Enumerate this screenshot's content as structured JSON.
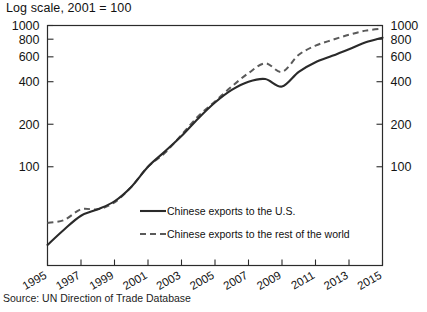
{
  "chart_data": {
    "type": "line",
    "title": "Log scale, 2001 = 100",
    "subtitle": "",
    "xlabel": "",
    "ylabel": "",
    "source": "Source: UN Direction of Trade Database",
    "log_scale": true,
    "grid": false,
    "legend_position": "inside-bottom-center",
    "xlim": [
      1995,
      2015
    ],
    "ylim": [
      20,
      1000
    ],
    "xticks": [
      1995,
      1997,
      1999,
      2001,
      2003,
      2005,
      2007,
      2009,
      2011,
      2013,
      2015
    ],
    "xtick_labels": [
      "1995",
      "1997",
      "1999",
      "2001",
      "2003",
      "2005",
      "2007",
      "2009",
      "2011",
      "2013",
      "2015"
    ],
    "yticks": [
      100,
      200,
      400,
      600,
      800,
      1000
    ],
    "ytick_labels": [
      "100",
      "200",
      "400",
      "600",
      "800",
      "1000"
    ],
    "right_axis_ticks": [
      100,
      200,
      400,
      600,
      800,
      1000
    ],
    "right_axis_labels": [
      "100",
      "200",
      "400",
      "600",
      "800",
      "1000"
    ],
    "x": [
      1995,
      1996,
      1997,
      1998,
      1999,
      2000,
      2001,
      2002,
      2003,
      2004,
      2005,
      2006,
      2007,
      2008,
      2009,
      2010,
      2011,
      2012,
      2013,
      2014,
      2015
    ],
    "series": [
      {
        "name": "Chinese exports to the U.S.",
        "style": "solid",
        "color": "#2a2a2a",
        "values": [
          28,
          36,
          45,
          50,
          57,
          72,
          100,
          128,
          165,
          220,
          285,
          350,
          400,
          418,
          370,
          470,
          550,
          610,
          680,
          760,
          820
        ]
      },
      {
        "name": "Chinese exports to the rest of the world",
        "style": "dashed",
        "color": "#5a5a5a",
        "values": [
          40,
          42,
          50,
          50,
          56,
          72,
          100,
          125,
          168,
          228,
          290,
          370,
          460,
          540,
          470,
          620,
          720,
          790,
          860,
          920,
          950
        ]
      }
    ],
    "legend": [
      {
        "label": "Chinese exports to the U.S.",
        "style": "solid"
      },
      {
        "label": "Chinese exports to the rest of the world",
        "style": "dashed"
      }
    ]
  }
}
